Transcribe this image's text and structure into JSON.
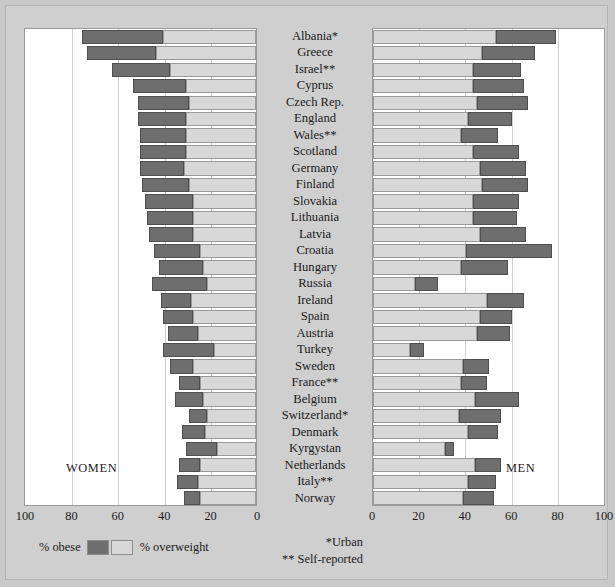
{
  "chart_data": {
    "type": "bar",
    "subtype": "diverging-stacked-bar-pyramid",
    "title": "",
    "xlabel": "",
    "ylabel": "",
    "legend": [
      {
        "key": "obese",
        "label": "% obese",
        "color": "#6e6e6e"
      },
      {
        "key": "overweight",
        "label": "% overweight",
        "color": "#d8d8d8"
      }
    ],
    "legend_position": "bottom-left",
    "grid": true,
    "panels": [
      {
        "key": "women",
        "caption": "WOMEN",
        "direction": "right-to-left",
        "axis": {
          "ticks": [
            100,
            80,
            60,
            40,
            20,
            0
          ],
          "tick_labels": [
            "100",
            "80",
            "60",
            "40",
            "20",
            "0"
          ],
          "range": [
            0,
            100
          ],
          "reversed": true
        }
      },
      {
        "key": "men",
        "caption": "MEN",
        "direction": "left-to-right",
        "axis": {
          "ticks": [
            0,
            20,
            40,
            60,
            80,
            100
          ],
          "tick_labels": [
            "0",
            "20",
            "40",
            "60",
            "80",
            "100"
          ],
          "range": [
            0,
            100
          ],
          "reversed": false
        }
      }
    ],
    "categories": [
      "Albania*",
      "Greece",
      "Israel**",
      "Cyprus",
      "Czech Rep.",
      "England",
      "Wales**",
      "Scotland",
      "Germany",
      "Finland",
      "Slovakia",
      "Lithuania",
      "Latvia",
      "Croatia",
      "Hungary",
      "Russia",
      "Ireland",
      "Spain",
      "Austria",
      "Turkey",
      "Sweden",
      "France**",
      "Belgium",
      "Switzerland*",
      "Denmark",
      "Kyrgystan",
      "Netherlands",
      "Italy**",
      "Norway"
    ],
    "series": [
      {
        "name": "women_overweight",
        "panel": "women",
        "segment": "overweight",
        "values": [
          40,
          43,
          37,
          30,
          29,
          30,
          30,
          30,
          31,
          29,
          27,
          27,
          27,
          24,
          23,
          21,
          28,
          27,
          25,
          18,
          27,
          24,
          23,
          21,
          22,
          17,
          24,
          25,
          24
        ]
      },
      {
        "name": "women_obese",
        "panel": "women",
        "segment": "obese",
        "values": [
          35,
          30,
          25,
          23,
          22,
          21,
          20,
          20,
          19,
          20,
          21,
          20,
          19,
          20,
          19,
          24,
          13,
          13,
          13,
          22,
          10,
          9,
          12,
          8,
          10,
          13,
          9,
          9,
          7
        ]
      },
      {
        "name": "men_overweight",
        "panel": "men",
        "segment": "overweight",
        "values": [
          53,
          47,
          43,
          43,
          45,
          41,
          38,
          43,
          46,
          47,
          43,
          43,
          46,
          40,
          38,
          18,
          49,
          46,
          45,
          16,
          39,
          38,
          44,
          37,
          41,
          31,
          44,
          41,
          39
        ]
      },
      {
        "name": "men_obese",
        "panel": "men",
        "segment": "obese",
        "values": [
          26,
          23,
          21,
          22,
          22,
          19,
          16,
          20,
          20,
          20,
          20,
          19,
          20,
          37,
          20,
          10,
          16,
          14,
          14,
          6,
          11,
          11,
          19,
          18,
          13,
          4,
          11,
          12,
          13
        ]
      }
    ],
    "footnotes": [
      "*Urban",
      "** Self-reported"
    ]
  }
}
